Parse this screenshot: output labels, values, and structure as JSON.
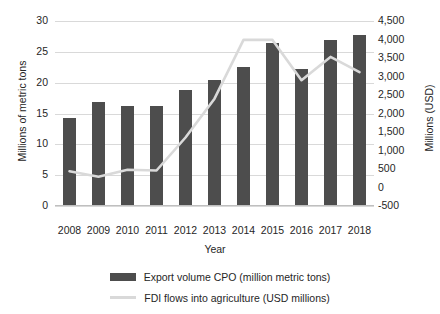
{
  "chart_data": {
    "type": "bar",
    "title": "",
    "xlabel": "Year",
    "ylabel": "Millions of metric tons",
    "y2label": "Millions (USD)",
    "categories": [
      "2008",
      "2009",
      "2010",
      "2011",
      "2012",
      "2013",
      "2014",
      "2015",
      "2016",
      "2017",
      "2018"
    ],
    "ylim": [
      0,
      30
    ],
    "yticks": [
      "0",
      "5",
      "10",
      "15",
      "20",
      "25",
      "30"
    ],
    "y2lim": [
      -500,
      4500
    ],
    "y2ticks": [
      "-500",
      "0",
      "500",
      "1,000",
      "1,500",
      "2,000",
      "2,500",
      "3,000",
      "3,500",
      "4,000",
      "4,500"
    ],
    "grid": true,
    "legend_position": "bottom",
    "series": [
      {
        "name": "Export volume CPO (million metric tons)",
        "type": "bar",
        "axis": "left",
        "color": "#4d4d4d",
        "values": [
          14.3,
          16.8,
          16.2,
          16.3,
          18.8,
          20.4,
          22.6,
          26.4,
          22.3,
          27.0,
          27.8
        ]
      },
      {
        "name": "FDI flows into agriculture (USD millions)",
        "type": "line",
        "axis": "right",
        "color": "#d9d9d9",
        "values": [
          440,
          290,
          480,
          460,
          1350,
          2400,
          3990,
          3990,
          2900,
          3530,
          3120
        ]
      }
    ]
  },
  "legend": {
    "items": [
      {
        "label": "Export volume CPO (million metric tons)",
        "marker": "bar-swatch"
      },
      {
        "label": "FDI flows into agriculture (USD millions)",
        "marker": "line-swatch"
      }
    ]
  }
}
